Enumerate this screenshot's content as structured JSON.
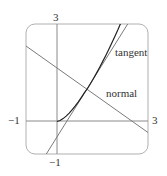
{
  "diagram": {
    "type": "function-graph",
    "curve": "y = x^(3/2)",
    "point_of_tangency": [
      1,
      1
    ],
    "tangent_line": "y = 1.5x - 0.5",
    "normal_line": "y = -2x/3 + 5/3",
    "viewport": {
      "xmin": -1,
      "xmax": 3,
      "ymin": -1,
      "ymax": 3
    }
  },
  "labels": {
    "tangent": "tangent",
    "normal": "normal",
    "x_min": "−1",
    "x_max": "3",
    "y_min": "−1",
    "y_max": "3"
  },
  "colors": {
    "frame": "#b0b0b0",
    "axes": "#8a8a8a",
    "lines": "#7a7a7a",
    "curve": "#222222",
    "text": "#333333"
  }
}
